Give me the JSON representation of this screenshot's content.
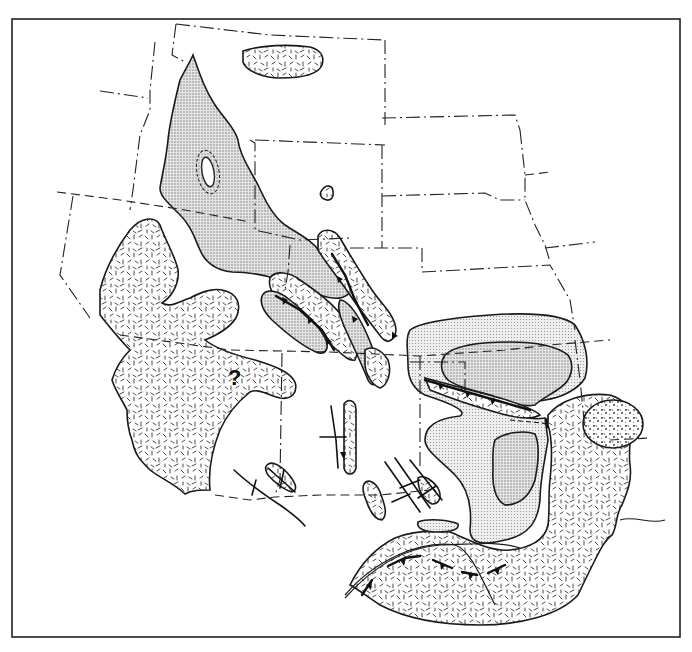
{
  "figure": {
    "type": "paleogeographic-map",
    "colors": {
      "background": "#ffffff",
      "line": "#1a1a1a",
      "stipple_fill": "#d6d6d6",
      "light_stipple_fill": "#e6e6e6"
    },
    "annotations": [
      {
        "id": "uncertain-area",
        "text": "?",
        "x": 233,
        "y": 383
      }
    ],
    "legend_patterns": [
      {
        "name": "dash-pattern",
        "description": "random short-dash hatch areas"
      },
      {
        "name": "fine-stipple",
        "description": "grey dotted areas"
      },
      {
        "name": "coarse-stipple",
        "description": "coarse dotted oval (east)"
      }
    ],
    "symbols": [
      "thrust-fault-with-teeth",
      "anticline-axis-arrows",
      "state-boundary-dash-dot",
      "flow-direction-arrow"
    ]
  }
}
